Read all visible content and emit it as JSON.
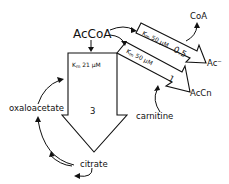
{
  "diagram": {
    "nodes": {
      "source": "AcCoA",
      "acetate": "Ac⁻",
      "coa": "CoA",
      "acetylcarnitine": "AcCn",
      "carnitine": "carnitine",
      "oxaloacetate": "oxaloacetate",
      "citrate": "citrate"
    },
    "flux_arrows": [
      {
        "id": "citrate-synthase",
        "km_label": "Km 21 μM",
        "flux": "3",
        "to": "citrate"
      },
      {
        "id": "acetyl-coa-hydrolase",
        "km_label": "Km 50 μM",
        "flux": "0.5",
        "to": "Ac⁻"
      },
      {
        "id": "carnitine-acetyltransferase",
        "km_label": "Km 50 μM",
        "flux": "1",
        "to": "AcCn"
      }
    ],
    "km_parts": {
      "k": "K",
      "m": "m",
      "v21": " 21 μM",
      "v50a": " 50 μM",
      "v50b": " 50 μM"
    }
  }
}
